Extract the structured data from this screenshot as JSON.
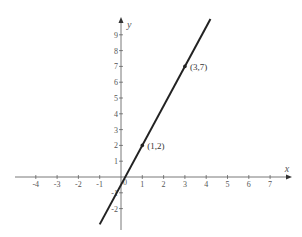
{
  "chart_data": {
    "type": "line",
    "title": "",
    "xlabel": "x",
    "ylabel": "y",
    "xlim": [
      -5,
      8
    ],
    "ylim": [
      -3,
      10
    ],
    "grid": false,
    "x_ticks": [
      -4,
      -3,
      -2,
      -1,
      1,
      2,
      3,
      4,
      5,
      6,
      7
    ],
    "y_ticks": [
      -2,
      -1,
      1,
      2,
      3,
      4,
      5,
      6,
      7,
      8,
      9
    ],
    "x_tick_labels": [
      "-4",
      "-3",
      "-2",
      "-1",
      "1",
      "2",
      "3",
      "4",
      "5",
      "6",
      "7"
    ],
    "y_tick_labels": [
      "-2",
      "-1",
      "1",
      "2",
      "3",
      "4",
      "5",
      "6",
      "7",
      "8",
      "9"
    ],
    "series": [
      {
        "name": "line",
        "equation": "y = 2.5x - 0.5",
        "x": [
          -1,
          4.2
        ],
        "y": [
          -3,
          10
        ],
        "color": "#222222"
      }
    ],
    "points": [
      {
        "x": 1,
        "y": 2,
        "label": "(1,2)"
      },
      {
        "x": 3,
        "y": 7,
        "label": "(3,7)"
      }
    ],
    "annotations": [
      "(1,2)",
      "(3,7)"
    ]
  },
  "colors": {
    "axis": "#555555",
    "line": "#222222",
    "background": "#ffffff"
  }
}
